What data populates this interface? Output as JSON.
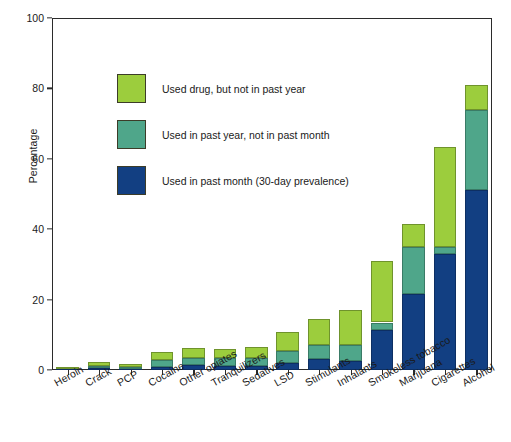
{
  "chart_data": {
    "type": "bar",
    "subtype": "stacked-bar",
    "title": "",
    "xlabel": "",
    "ylabel": "Percentage",
    "ylim": [
      0,
      100
    ],
    "yticks": [
      0,
      20,
      40,
      60,
      80,
      100
    ],
    "grid": false,
    "legend_position": "upper-left-inside",
    "categories": [
      "Heroin",
      "Crack",
      "PCP",
      "Cocaine",
      "Other opiates",
      "Tranquilizers",
      "Sedatives",
      "LSD",
      "Stimulants",
      "Inhalants",
      "Smokeless tobacco",
      "Marijuana",
      "Cigarettes",
      "Alcohol"
    ],
    "series": [
      {
        "name": "Used in past month (30-day prevalence)",
        "color": "#123f82",
        "values": [
          0.2,
          0.6,
          0.3,
          0.8,
          1.3,
          1.2,
          1.2,
          2.0,
          3.0,
          2.5,
          11.5,
          21.5,
          33.0,
          51.0
        ]
      },
      {
        "name": "Used in past year, not in past month",
        "color": "#4fa68a",
        "values": [
          0.2,
          0.6,
          0.5,
          2.0,
          2.2,
          2.1,
          2.2,
          3.5,
          4.0,
          4.5,
          2.0,
          13.5,
          2.0,
          23.0
        ]
      },
      {
        "name": "Used drug, but not in past year",
        "color": "#9ccd3d",
        "values": [
          0.5,
          1.1,
          0.9,
          2.4,
          2.7,
          2.8,
          3.2,
          5.3,
          7.5,
          10.0,
          17.5,
          6.5,
          28.5,
          7.0
        ]
      }
    ],
    "totals": [
      0.9,
      2.3,
      1.7,
      5.2,
      6.2,
      6.1,
      6.6,
      10.8,
      14.5,
      17.0,
      31.0,
      41.5,
      63.5,
      81.0
    ]
  },
  "legend": {
    "entries": [
      {
        "label": "Used drug, but not in past year",
        "color": "#9ccd3d"
      },
      {
        "label": "Used in past year, not in past month",
        "color": "#4fa68a"
      },
      {
        "label": "Used in past month (30-day prevalence)",
        "color": "#123f82"
      }
    ]
  },
  "axis": {
    "y_title": "Percentage",
    "y_tick_labels": [
      "0",
      "20",
      "40",
      "60",
      "80",
      "100"
    ]
  }
}
